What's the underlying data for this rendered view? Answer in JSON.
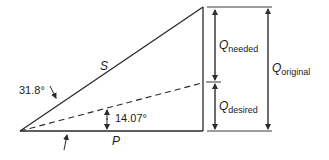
{
  "diagram": {
    "type": "power-triangle",
    "labels": {
      "hypotenuse": "S",
      "base": "P",
      "angle_original": "31.8°",
      "angle_desired": "14.07°",
      "q_needed_main": "Q",
      "q_needed_sub": "needed",
      "q_desired_main": "Q",
      "q_desired_sub": "desired",
      "q_original_main": "Q",
      "q_original_sub": "original"
    },
    "colors": {
      "line": "#2a2a2a",
      "dimension": "#3a3a3a",
      "background": "#ffffff"
    }
  }
}
